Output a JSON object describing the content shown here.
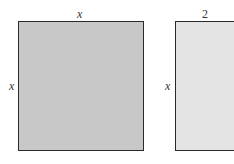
{
  "diagram": {
    "tiles": [
      {
        "name": "x-squared-tile",
        "top_label": "x",
        "side_label": "x",
        "fill": "#c8c8c8"
      },
      {
        "name": "two-x-tile",
        "top_label": "2",
        "side_label": "x",
        "fill": "#e4e4e4"
      }
    ]
  }
}
